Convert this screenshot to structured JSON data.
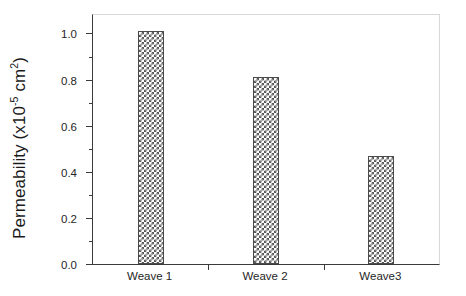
{
  "chart_data": {
    "type": "bar",
    "title": "",
    "xlabel": "",
    "ylabel": "Permeability (x10-5 cm2)",
    "ylabel_parts": {
      "prefix": "Permeability (x10",
      "exp1": "-5",
      "mid": " cm",
      "exp2": "2",
      "suffix": ")"
    },
    "categories": [
      "Weave 1",
      "Weave 2",
      "Weave3"
    ],
    "values": [
      1.01,
      0.81,
      0.47
    ],
    "ylim": [
      0.0,
      1.08
    ],
    "ytick_labels": [
      "0.0",
      "0.2",
      "0.4",
      "0.6",
      "0.8",
      "1.0"
    ],
    "ytick_values": [
      0.0,
      0.2,
      0.4,
      0.6,
      0.8,
      1.0
    ],
    "yminor_values": [
      0.1,
      0.3,
      0.5,
      0.7,
      0.9
    ],
    "xtick_positions": [
      0.333,
      0.667
    ],
    "grid": false,
    "legend": null,
    "bar_fill": "cross-hatch-checker",
    "bar_edge_color": "#4a4a4a",
    "axis_color": "#3a3a3a",
    "background": "#ffffff"
  }
}
